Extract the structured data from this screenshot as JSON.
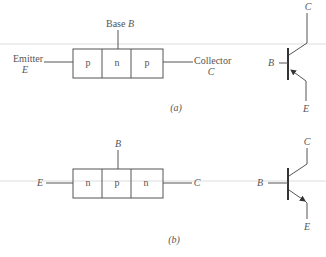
{
  "figure_a": {
    "label": "(a)",
    "type": "pnp",
    "regions": [
      "p",
      "n",
      "p"
    ],
    "base_label": "Base ",
    "base_symbol": "B",
    "emitter_label": "Emitter",
    "emitter_symbol": "E",
    "collector_label": "Collector",
    "collector_symbol": "C",
    "symbol": {
      "b": "B",
      "c": "C",
      "e": "E"
    }
  },
  "figure_b": {
    "label": "(b)",
    "type": "npn",
    "regions": [
      "n",
      "p",
      "n"
    ],
    "base_symbol": "B",
    "emitter_symbol": "E",
    "collector_symbol": "C",
    "symbol": {
      "b": "B",
      "c": "C",
      "e": "E"
    }
  },
  "colors": {
    "line": "#555555",
    "background": "#ffffff"
  }
}
